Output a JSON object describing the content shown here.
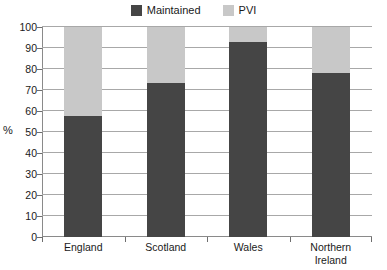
{
  "chart_data": {
    "type": "bar",
    "subtype": "stacked-100",
    "title": "",
    "xlabel": "",
    "ylabel": "%",
    "ylim": [
      0,
      100
    ],
    "ytick_step": 10,
    "grid": true,
    "legend_position": "top-center",
    "categories": [
      "England",
      "Scotland",
      "Wales",
      "Northern Ireland"
    ],
    "category_lines": [
      [
        "England"
      ],
      [
        "Scotland"
      ],
      [
        "Wales"
      ],
      [
        "Northern",
        "Ireland"
      ]
    ],
    "ytick_labels": [
      "100",
      "90",
      "80",
      "70",
      "60",
      "50",
      "40",
      "30",
      "20",
      "10",
      "0"
    ],
    "ytick_values": [
      100,
      90,
      80,
      70,
      60,
      50,
      40,
      30,
      20,
      10,
      0
    ],
    "series": [
      {
        "name": "Maintained",
        "color": "#454545",
        "values": [
          57.5,
          73.5,
          93.0,
          78.0
        ]
      },
      {
        "name": "PVI",
        "color": "#c8c8c8",
        "values": [
          42.5,
          26.5,
          7.0,
          22.0
        ]
      }
    ]
  },
  "legend": {
    "items": [
      {
        "label": "Maintained",
        "color": "#454545"
      },
      {
        "label": "PVI",
        "color": "#c8c8c8"
      }
    ]
  },
  "axes": {
    "y_title": "%"
  },
  "colors": {
    "maintained": "#454545",
    "pvi": "#c8c8c8",
    "axis": "#8a8a8a",
    "grid": "#a8a8a8",
    "text": "#1a1a1a",
    "background": "#ffffff"
  }
}
